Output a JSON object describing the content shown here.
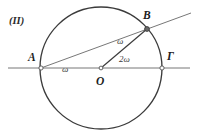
{
  "figure": {
    "caption": "(II)",
    "colors": {
      "circle_stroke": "#3b3b3b",
      "line_stroke": "#6e6e6e",
      "radius_stroke": "#3b3b3b",
      "point_fill": "#ffffff",
      "point_stroke": "#555555",
      "background": "#ffffff",
      "text": "#2a2a2a"
    }
  },
  "points": {
    "A": {
      "label": "A",
      "x": 41,
      "y": 68
    },
    "B": {
      "label": "B",
      "x": 147,
      "y": 29
    },
    "Gamma": {
      "label": "Γ",
      "x": 162,
      "y": 68
    },
    "O": {
      "label": "O",
      "x": 101,
      "y": 68
    }
  },
  "circle": {
    "center_x": 101,
    "center_y": 68,
    "radius": 61
  },
  "angles": {
    "at_A": "ω",
    "at_B": "ω",
    "at_O": "2ω"
  },
  "segments": {
    "diameter": "AΓ",
    "secant": "AB",
    "radius": "OB"
  }
}
